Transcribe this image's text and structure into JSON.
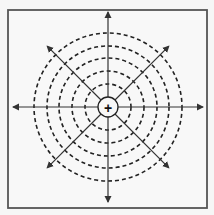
{
  "diagram": {
    "title": "",
    "frame": {
      "x": 8,
      "y": 10,
      "width": 199,
      "height": 198,
      "stroke": "#555555"
    },
    "center": {
      "x": 108,
      "y": 107,
      "radius": 10,
      "symbol": "+"
    },
    "rings": {
      "radii": [
        23,
        36,
        49,
        61,
        74
      ],
      "style": "dashed",
      "stroke": "#222222"
    },
    "arrows": {
      "axial_length": 95,
      "diagonal_length": 86,
      "directions": [
        "right",
        "up-right",
        "up",
        "up-left",
        "left",
        "down-left",
        "down",
        "down-right"
      ],
      "stroke": "#333333"
    },
    "colors": {
      "background": "#f6f6f6",
      "ink": "#222222"
    }
  }
}
